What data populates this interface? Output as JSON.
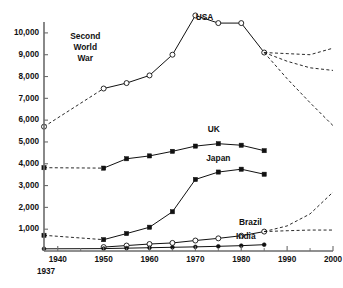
{
  "chart_data": {
    "type": "line",
    "title": "",
    "subtitle": "",
    "xlabel": "",
    "ylabel": "",
    "xlim": [
      1937,
      2000
    ],
    "ylim": [
      0,
      10500
    ],
    "grid": false,
    "legend": "inline-labels",
    "y_ticks": [
      1000,
      2000,
      3000,
      4000,
      5000,
      6000,
      7000,
      8000,
      9000,
      10000
    ],
    "y_tick_labels": [
      "1,000",
      "2,000",
      "3,000",
      "4,000",
      "5,000",
      "6,000",
      "7,000",
      "8,000",
      "9,000",
      "10,000"
    ],
    "x_ticks": [
      1940,
      1950,
      1960,
      1970,
      1980,
      1990,
      2000
    ],
    "x_tick_labels": [
      "1940",
      "1950",
      "1960",
      "1970",
      "1980",
      "1990",
      "2000"
    ],
    "x_minor_ticks": [
      1945,
      1955,
      1965,
      1975,
      1985,
      1995
    ],
    "x_origin_label": "1937",
    "annotations": [
      {
        "text": "Second World War",
        "lines": [
          "Second",
          "World",
          "War"
        ],
        "x": 1946,
        "y": 9700
      }
    ],
    "series": [
      {
        "name": "USA",
        "label": "USA",
        "label_x": 1972,
        "label_y": 10600,
        "marker": "open-circle",
        "x": [
          1937,
          1950,
          1955,
          1960,
          1965,
          1970,
          1975,
          1980,
          1985
        ],
        "values": [
          5700,
          7450,
          7700,
          8050,
          9000,
          10800,
          10450,
          10450,
          9100
        ],
        "gap_dashed_from": 1937,
        "gap_dashed_to": 1950
      },
      {
        "name": "UK",
        "label": "UK",
        "label_x": 1974,
        "label_y": 5450,
        "marker": "filled-square",
        "x": [
          1937,
          1950,
          1955,
          1960,
          1965,
          1970,
          1975,
          1980,
          1985
        ],
        "values": [
          3820,
          3800,
          4230,
          4360,
          4570,
          4810,
          4920,
          4850,
          4600
        ],
        "gap_dashed_from": 1937,
        "gap_dashed_to": 1950
      },
      {
        "name": "Japan",
        "label": "Japan",
        "label_x": 1975,
        "label_y": 4120,
        "marker": "filled-square",
        "x": [
          1937,
          1950,
          1955,
          1960,
          1965,
          1970,
          1975,
          1980,
          1985
        ],
        "values": [
          720,
          520,
          800,
          1090,
          1800,
          3280,
          3620,
          3750,
          3520
        ],
        "gap_dashed_from": 1937,
        "gap_dashed_to": 1950
      },
      {
        "name": "Brazil",
        "label": "Brazil",
        "label_x": 1982,
        "label_y": 1180,
        "marker": "open-circle",
        "x": [
          1950,
          1955,
          1960,
          1965,
          1970,
          1975,
          1980,
          1985
        ],
        "values": [
          180,
          250,
          320,
          370,
          480,
          580,
          700,
          890
        ]
      },
      {
        "name": "India",
        "label": "India",
        "label_x": 1981,
        "label_y": 560,
        "marker": "filled-circle",
        "x": [
          1937,
          1950,
          1955,
          1960,
          1965,
          1970,
          1975,
          1980,
          1985
        ],
        "values": [
          100,
          110,
          130,
          150,
          170,
          190,
          215,
          245,
          290
        ]
      }
    ],
    "projections": [
      {
        "of": "USA",
        "scenario": "high",
        "x": [
          1985,
          1990,
          1995,
          2000
        ],
        "values": [
          9100,
          9050,
          9000,
          9300
        ]
      },
      {
        "of": "USA",
        "scenario": "mid",
        "x": [
          1985,
          1990,
          1995,
          2000
        ],
        "values": [
          9100,
          8700,
          8400,
          8280
        ]
      },
      {
        "of": "USA",
        "scenario": "low",
        "x": [
          1985,
          1990,
          1995,
          2000
        ],
        "values": [
          9100,
          7900,
          6800,
          5750
        ]
      },
      {
        "of": "Brazil",
        "scenario": "high",
        "x": [
          1985,
          1990,
          1995,
          2000
        ],
        "values": [
          890,
          1150,
          1700,
          2700
        ]
      },
      {
        "of": "Brazil",
        "scenario": "low",
        "x": [
          1985,
          1990,
          1995,
          2000
        ],
        "values": [
          890,
          930,
          960,
          960
        ]
      }
    ]
  }
}
